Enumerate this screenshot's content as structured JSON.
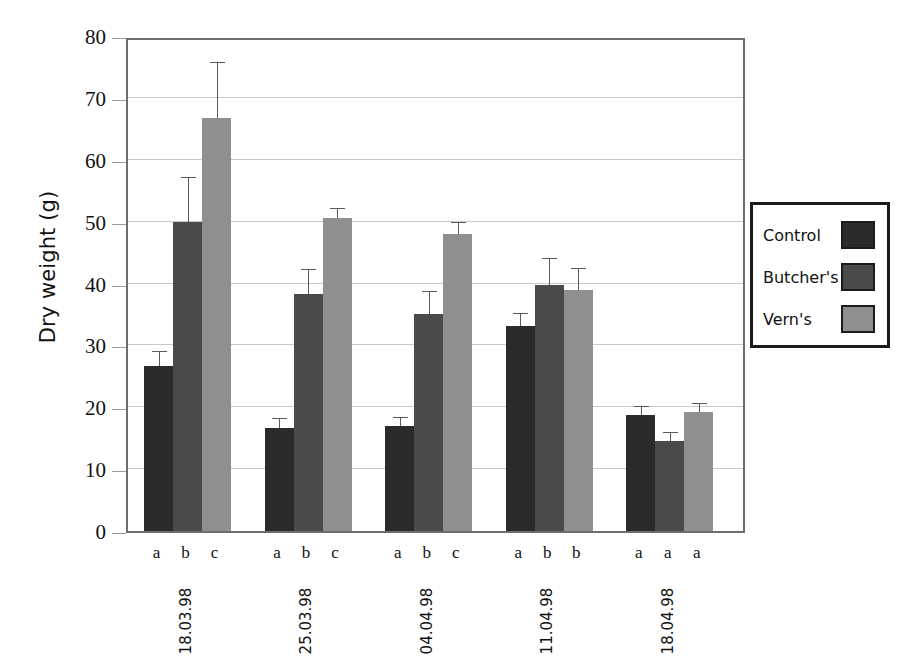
{
  "chart_data": {
    "type": "bar",
    "title": "",
    "xlabel": "",
    "ylabel": "Dry weight (g)",
    "ylim": [
      0,
      80
    ],
    "yticks": [
      0,
      10,
      20,
      30,
      40,
      50,
      60,
      70,
      80
    ],
    "ytick_labels": [
      "0",
      "10",
      "20",
      "30",
      "40",
      "50",
      "60",
      "70",
      "80"
    ],
    "grid": true,
    "legend_position": "right-outside",
    "categories": [
      "18.03.98",
      "25.03.98",
      "04.04.98",
      "11.04.98",
      "18.04.98"
    ],
    "series": [
      {
        "name": "Control",
        "color": "#2b2b2b",
        "values": [
          26.6,
          16.7,
          17.0,
          33.1,
          18.8
        ],
        "errors": [
          2.4,
          1.4,
          1.3,
          2.0,
          1.2
        ]
      },
      {
        "name": "Butcher's",
        "color": "#4a4a4a",
        "values": [
          50.0,
          38.3,
          35.0,
          39.8,
          14.6
        ],
        "errors": [
          7.0,
          3.9,
          3.6,
          4.2,
          1.3
        ]
      },
      {
        "name": "Vern's",
        "color": "#8f8f8f",
        "values": [
          66.7,
          50.6,
          48.0,
          39.0,
          19.3
        ],
        "errors": [
          9.0,
          1.4,
          1.7,
          3.3,
          1.3
        ]
      }
    ],
    "significance_letters": [
      [
        "a",
        "b",
        "c"
      ],
      [
        "a",
        "b",
        "c"
      ],
      [
        "a",
        "b",
        "c"
      ],
      [
        "a",
        "b",
        "b"
      ],
      [
        "a",
        "a",
        "a"
      ]
    ]
  },
  "legend": {
    "items": [
      {
        "label": "Control",
        "color": "#2b2b2b"
      },
      {
        "label": "Butcher's",
        "color": "#4a4a4a"
      },
      {
        "label": "Vern's",
        "color": "#8f8f8f"
      }
    ]
  },
  "axes": {
    "y_title": "Dry weight (g)"
  }
}
